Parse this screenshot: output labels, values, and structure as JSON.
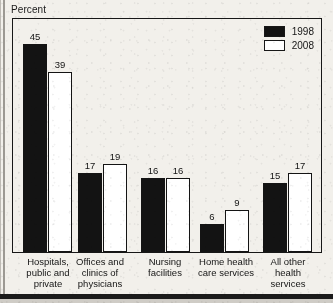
{
  "chart_data": {
    "type": "bar",
    "title": "",
    "subtitle": "",
    "xlabel": "",
    "ylabel": "Percent",
    "ylim": [
      0,
      50
    ],
    "grid": false,
    "legend_position": "top-right",
    "categories": [
      "Hospitals, public and private",
      "Offices and clinics of physicians",
      "Nursing facilities",
      "Home health care services",
      "All other health services"
    ],
    "category_lines": [
      [
        "Hospitals,",
        "public and",
        "private"
      ],
      [
        "Offices and",
        "clinics of",
        "physicians"
      ],
      [
        "Nursing",
        "facilities"
      ],
      [
        "Home health",
        "care services"
      ],
      [
        "All other",
        "health",
        "services"
      ]
    ],
    "series": [
      {
        "name": "1998",
        "color": "#131313",
        "style": "filled",
        "values": [
          45,
          17,
          16,
          6,
          15
        ]
      },
      {
        "name": "2008",
        "color": "#ffffff",
        "style": "hollow",
        "values": [
          39,
          19,
          16,
          9,
          17
        ]
      }
    ]
  },
  "legend": {
    "items": [
      {
        "label": "1998",
        "style": "filled"
      },
      {
        "label": "2008",
        "style": "hollow"
      }
    ]
  }
}
